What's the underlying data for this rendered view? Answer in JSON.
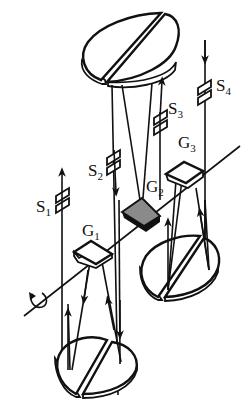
{
  "diagram": {
    "type": "optical-schematic",
    "labels": {
      "S1": {
        "main": "S",
        "sub": "1"
      },
      "S2": {
        "main": "S",
        "sub": "2"
      },
      "S3": {
        "main": "S",
        "sub": "3"
      },
      "S4": {
        "main": "S",
        "sub": "4"
      },
      "G1": {
        "main": "G",
        "sub": "1"
      },
      "G2": {
        "main": "G",
        "sub": "2"
      },
      "G3": {
        "main": "G",
        "sub": "3"
      }
    },
    "colors": {
      "line": "#111111",
      "background": "#ffffff",
      "shaded_element": "#8a8a8a"
    },
    "elements": [
      {
        "id": "mirror-top",
        "kind": "split-disc-mirror"
      },
      {
        "id": "mirror-lower-right",
        "kind": "split-disc-mirror"
      },
      {
        "id": "mirror-bottom",
        "kind": "split-disc-mirror"
      },
      {
        "id": "G1",
        "kind": "plate",
        "shaded": false
      },
      {
        "id": "G2",
        "kind": "plate",
        "shaded": true
      },
      {
        "id": "G3",
        "kind": "plate",
        "shaded": false
      },
      {
        "id": "rotation-axis",
        "kind": "axis-with-rotation-arrow"
      }
    ]
  }
}
